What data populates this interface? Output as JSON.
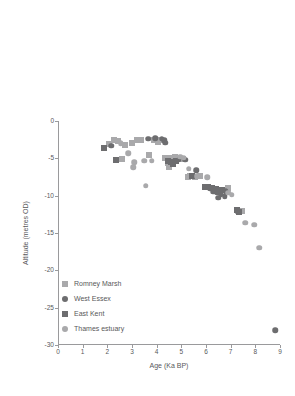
{
  "chart_data": {
    "type": "scatter",
    "title": "",
    "xlabel": "Age (Ka BP)",
    "ylabel": "Altitude (metres OD)",
    "xlim": [
      0,
      9
    ],
    "ylim": [
      -30,
      0
    ],
    "xticks": [
      0,
      1,
      2,
      3,
      4,
      5,
      6,
      7,
      8,
      9
    ],
    "yticks": [
      0,
      -5,
      -10,
      -15,
      -20,
      -25,
      -30
    ],
    "xtick_labels": [
      "0",
      "1",
      "2",
      "3",
      "4",
      "5",
      "6",
      "7",
      "8",
      "9"
    ],
    "ytick_labels": [
      "0",
      "-5",
      "-10",
      "-15",
      "-20",
      "-25",
      "-30"
    ],
    "grid": false,
    "legend_position": "lower-left-inside",
    "series": [
      {
        "name": "Romney Marsh",
        "marker": "square",
        "color": "#a9a9ab",
        "points": [
          [
            2.05,
            -3.1
          ],
          [
            2.25,
            -2.6
          ],
          [
            2.45,
            -2.7
          ],
          [
            2.7,
            -3.2
          ],
          [
            3.0,
            -3.0
          ],
          [
            3.2,
            -2.6
          ],
          [
            3.35,
            -2.6
          ],
          [
            3.9,
            -2.6
          ],
          [
            4.05,
            -2.8
          ],
          [
            4.15,
            -2.6
          ],
          [
            2.6,
            -5.1
          ],
          [
            3.7,
            -4.6
          ],
          [
            4.35,
            -5.0
          ],
          [
            4.55,
            -4.9
          ],
          [
            4.75,
            -4.8
          ],
          [
            4.9,
            -5.0
          ],
          [
            5.05,
            -5.1
          ],
          [
            4.45,
            -5.6
          ],
          [
            4.5,
            -6.2
          ],
          [
            5.35,
            -7.4
          ],
          [
            5.55,
            -7.5
          ],
          [
            5.75,
            -7.3
          ],
          [
            5.25,
            -7.5
          ],
          [
            6.05,
            -8.8
          ],
          [
            6.35,
            -9.2
          ],
          [
            6.55,
            -9.3
          ],
          [
            6.9,
            -9.0
          ],
          [
            7.3,
            -12.0
          ],
          [
            7.45,
            -12.1
          ]
        ]
      },
      {
        "name": "West Essex",
        "marker": "circle",
        "color": "#6d6d6f",
        "points": [
          [
            2.15,
            -3.3
          ],
          [
            3.65,
            -2.4
          ],
          [
            3.95,
            -2.3
          ],
          [
            4.2,
            -2.4
          ],
          [
            4.3,
            -2.6
          ],
          [
            4.35,
            -2.9
          ],
          [
            4.9,
            -5.2
          ],
          [
            5.15,
            -5.2
          ],
          [
            5.6,
            -6.6
          ],
          [
            6.15,
            -9.1
          ],
          [
            6.3,
            -9.5
          ],
          [
            6.45,
            -9.6
          ],
          [
            6.6,
            -9.8
          ],
          [
            6.75,
            -10.1
          ],
          [
            6.5,
            -10.3
          ],
          [
            6.8,
            -9.4
          ],
          [
            8.8,
            -28.0
          ]
        ]
      },
      {
        "name": "East Kent",
        "marker": "square",
        "color": "#6d6d6f",
        "points": [
          [
            1.85,
            -3.6
          ],
          [
            2.35,
            -5.2
          ],
          [
            4.45,
            -5.4
          ],
          [
            4.6,
            -5.5
          ],
          [
            4.65,
            -5.8
          ],
          [
            4.8,
            -5.3
          ],
          [
            5.45,
            -7.4
          ],
          [
            5.95,
            -8.9
          ],
          [
            6.1,
            -8.8
          ],
          [
            6.25,
            -9.0
          ],
          [
            6.4,
            -9.1
          ],
          [
            6.65,
            -9.2
          ],
          [
            7.25,
            -11.9
          ],
          [
            7.35,
            -12.2
          ]
        ]
      },
      {
        "name": "Thames estuary",
        "marker": "circle",
        "color": "#a9a9ab",
        "points": [
          [
            2.55,
            -3.0
          ],
          [
            2.85,
            -4.3
          ],
          [
            3.1,
            -5.5
          ],
          [
            3.05,
            -6.2
          ],
          [
            3.5,
            -5.3
          ],
          [
            3.8,
            -5.3
          ],
          [
            3.55,
            -8.7
          ],
          [
            4.95,
            -4.8
          ],
          [
            5.1,
            -4.9
          ],
          [
            5.3,
            -6.4
          ],
          [
            5.65,
            -7.4
          ],
          [
            6.05,
            -7.5
          ],
          [
            6.9,
            -9.6
          ],
          [
            7.05,
            -9.9
          ],
          [
            7.6,
            -13.6
          ],
          [
            7.95,
            -13.9
          ],
          [
            8.15,
            -17.0
          ]
        ]
      }
    ]
  },
  "legend": {
    "items": [
      {
        "label": "Romney Marsh",
        "marker": "square",
        "color": "#a9a9ab"
      },
      {
        "label": "West Essex",
        "marker": "circle",
        "color": "#6d6d6f"
      },
      {
        "label": "East Kent",
        "marker": "square",
        "color": "#6d6d6f"
      },
      {
        "label": "Thames estuary",
        "marker": "circle",
        "color": "#a9a9ab"
      }
    ]
  }
}
